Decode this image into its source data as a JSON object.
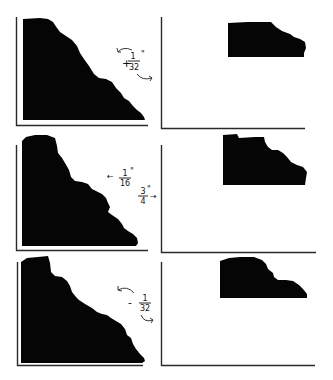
{
  "figure": {
    "colors": {
      "profile": "#050505",
      "frame": "#2a2a2a",
      "background": "#ffffff"
    },
    "panels": [
      {
        "id": "panel-1",
        "annotation": {
          "sign": "+",
          "numerator": "1",
          "denominator": "32",
          "unit": "\"",
          "icons": [
            "curved-arrow-left-icon",
            "curved-arrow-right-icon"
          ]
        }
      },
      {
        "id": "panel-2",
        "annotations": [
          {
            "arrow": "←",
            "numerator": "1",
            "denominator": "16",
            "unit": "\""
          },
          {
            "arrow": "→",
            "numerator": "3",
            "denominator": "4",
            "unit": "\""
          }
        ]
      },
      {
        "id": "panel-3",
        "annotation": {
          "sign": "-",
          "numerator": "1",
          "denominator": "32",
          "unit": "",
          "icons": [
            "curved-arrow-left-icon",
            "curved-arrow-right-icon"
          ]
        }
      }
    ]
  }
}
